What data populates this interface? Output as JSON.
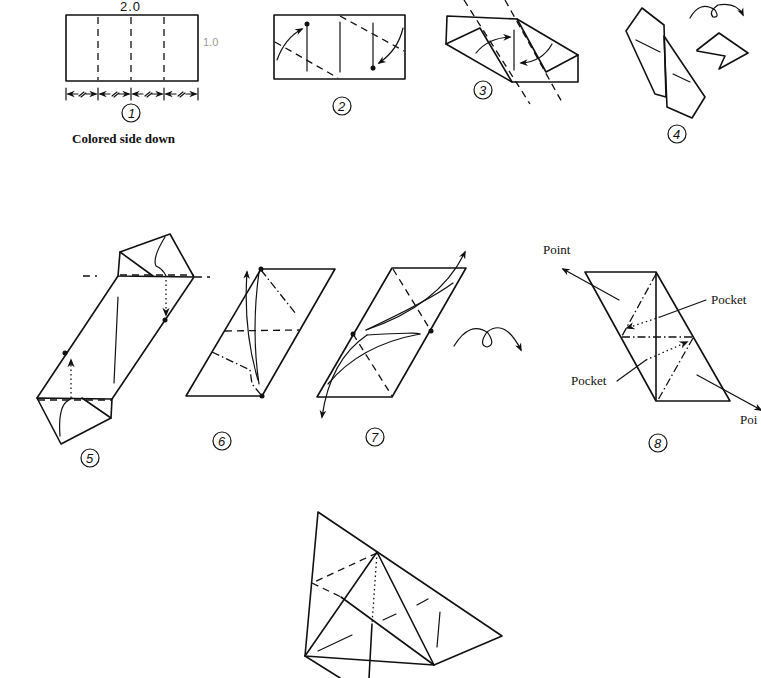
{
  "step1": {
    "number": "1",
    "width_label": "2.0",
    "height_label": "1.0",
    "caption": "Colored side down",
    "divisions": 4
  },
  "step2": {
    "number": "2"
  },
  "step3": {
    "number": "3"
  },
  "step4": {
    "number": "4"
  },
  "step5": {
    "number": "5"
  },
  "step6": {
    "number": "6"
  },
  "step7": {
    "number": "7"
  },
  "step8": {
    "number": "8",
    "labels": {
      "point_top": "Point",
      "pocket_top": "Pocket",
      "pocket_bottom": "Pocket",
      "point_bottom": "Poi"
    }
  },
  "legend": {
    "turn_over_icon": "turn-over-arrow",
    "push_icon": "push-arrow"
  }
}
